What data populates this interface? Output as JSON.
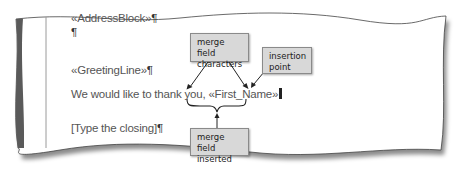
{
  "document": {
    "lines": [
      {
        "text": "«AddressBlock»",
        "mark": "¶"
      },
      {
        "text": "",
        "mark": "¶"
      },
      {
        "text": "«GreetingLine»",
        "mark": "¶"
      },
      {
        "text": "We would like to thank you, ",
        "field": "«First_Name»",
        "mark": "¶"
      },
      {
        "text": "[Type the closing]",
        "mark": "¶"
      }
    ]
  },
  "callouts": {
    "merge_field_characters": {
      "line1": "merge field",
      "line2": "characters"
    },
    "insertion_point": {
      "line1": "insertion",
      "line2": "point"
    },
    "merge_field_inserted": {
      "line1": "merge field",
      "line2": "inserted"
    }
  },
  "colors": {
    "callout_bg": "#d8d8d8",
    "left_bar": "#5a5a5a",
    "text": "#555555"
  }
}
